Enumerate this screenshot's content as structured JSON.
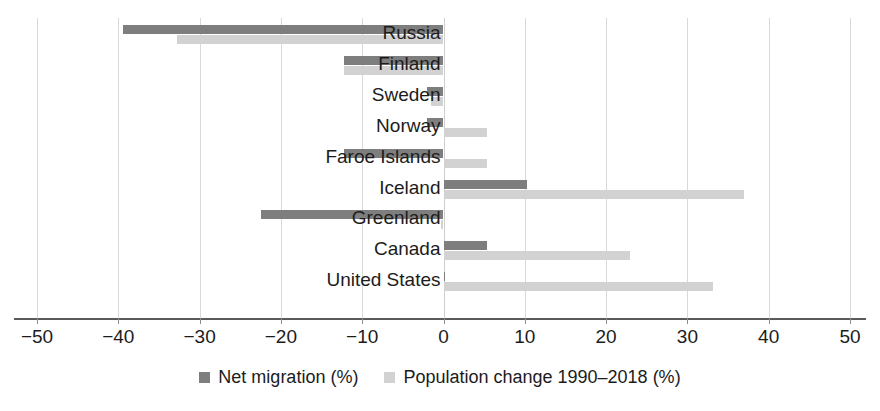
{
  "chart_data": {
    "type": "bar",
    "orientation": "horizontal",
    "title": "",
    "subtitle": "",
    "xlabel": "",
    "ylabel": "",
    "xlim": [
      -50,
      50
    ],
    "xticks": [
      -50,
      -40,
      -30,
      -20,
      -10,
      0,
      10,
      20,
      30,
      40,
      50
    ],
    "xtick_labels": [
      "−50",
      "−40",
      "−30",
      "−20",
      "−10",
      "0",
      "10",
      "20",
      "30",
      "40",
      "50"
    ],
    "grid": true,
    "grid_axis": "x",
    "legend_position": "bottom",
    "categories": [
      "Russia",
      "Finland",
      "Sweden",
      "Norway",
      "Faroe Islands",
      "Iceland",
      "Greenland",
      "Canada",
      "United States"
    ],
    "series": [
      {
        "name": "Net migration (%)",
        "color": "#7e7e7e",
        "values": [
          -39.4,
          -12.3,
          -2.0,
          -2.0,
          -12.3,
          10.3,
          -22.4,
          5.4,
          0.2
        ]
      },
      {
        "name": "Population change 1990–2018 (%)",
        "color": "#d2d2d2",
        "values": [
          -32.8,
          -12.3,
          -1.5,
          5.4,
          5.4,
          37.0,
          -0.3,
          23.0,
          33.1
        ]
      }
    ]
  },
  "legend": {
    "items": [
      {
        "label": "Net migration (%)",
        "color": "#7e7e7e",
        "marker": "square-swatch"
      },
      {
        "label": "Population change 1990–2018 (%)",
        "color": "#d2d2d2",
        "marker": "square-swatch"
      }
    ]
  },
  "axis": {
    "color": "#5a5a5a",
    "grid_color": "#d9d9d9"
  }
}
